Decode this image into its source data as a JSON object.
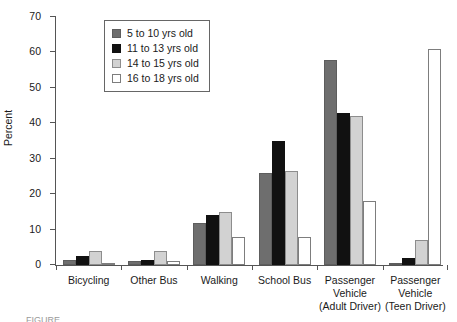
{
  "chart_data": {
    "type": "bar",
    "title": "",
    "xlabel": "",
    "ylabel": "Percent",
    "ylim": [
      0,
      70
    ],
    "yticks": [
      0,
      10,
      20,
      30,
      40,
      50,
      60,
      70
    ],
    "grid": false,
    "legend_position": "top-left-inside",
    "categories": [
      "Bicycling",
      "Other Bus",
      "Walking",
      "School Bus",
      "Passenger Vehicle (Adult Driver)",
      "Passenger Vehicle (Teen Driver)"
    ],
    "category_label_lines": [
      [
        "Bicycling"
      ],
      [
        "Other Bus"
      ],
      [
        "Walking"
      ],
      [
        "School Bus"
      ],
      [
        "Passenger",
        "Vehicle",
        "(Adult Driver)"
      ],
      [
        "Passenger",
        "Vehicle",
        "(Teen Driver)"
      ]
    ],
    "series": [
      {
        "name": "5 to 10 yrs old",
        "color": "#6e6e6e",
        "values": [
          1.5,
          1.0,
          12.0,
          26.0,
          58.0,
          0.3
        ]
      },
      {
        "name": "11 to 13 yrs old",
        "color": "#111111",
        "values": [
          2.5,
          1.5,
          14.0,
          35.0,
          43.0,
          2.0
        ]
      },
      {
        "name": "14 to 15 yrs old",
        "color": "#d2d2d2",
        "values": [
          4.0,
          4.0,
          15.0,
          26.5,
          42.0,
          7.0
        ]
      },
      {
        "name": "16 to 18 yrs old",
        "color": "#ffffff",
        "values": [
          0.3,
          1.0,
          8.0,
          8.0,
          18.0,
          61.0
        ]
      }
    ]
  },
  "legend": {
    "items": [
      {
        "label": "5 to 10 yrs old"
      },
      {
        "label": "11 to 13 yrs old"
      },
      {
        "label": "14 to 15 yrs old"
      },
      {
        "label": "16 to 18 yrs old"
      }
    ]
  },
  "caption": {
    "text": "FIGURE"
  }
}
